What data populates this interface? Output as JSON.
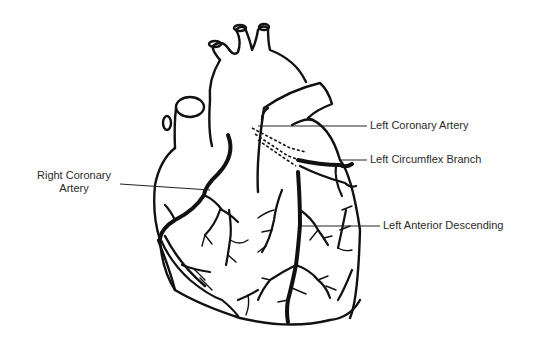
{
  "diagram": {
    "labels": [
      {
        "id": "left-coronary-artery",
        "text": "Left Coronary Artery"
      },
      {
        "id": "left-circumflex-branch",
        "text": "Left Circumflex Branch"
      },
      {
        "id": "right-coronary-artery",
        "lines": [
          "Right Coronary",
          "Artery"
        ]
      },
      {
        "id": "left-anterior-descending",
        "text": "Left Anterior Descending"
      }
    ],
    "colors": {
      "line": "#111111",
      "text": "#2a2a2a",
      "background": "#ffffff"
    }
  }
}
